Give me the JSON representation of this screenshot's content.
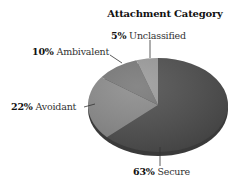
{
  "chart_data": {
    "type": "pie",
    "title": "Attachment Category",
    "categories": [
      "Secure",
      "Avoidant",
      "Ambivalent",
      "Unclassified"
    ],
    "values": [
      63,
      22,
      10,
      5
    ],
    "labels": [
      "63% Secure",
      "22% Avoidant",
      "10% Ambivalent",
      "5% Unclassified"
    ],
    "colors": [
      "#4d4d4d",
      "#8a8a8a",
      "#777777",
      "#9a9a9a"
    ],
    "start_angle": "12 o'clock, clockwise",
    "legend": "none (callout labels with leader lines)",
    "style": "3D tilted pie"
  },
  "labels": {
    "title": "Attachment Category",
    "secure_pct": "63%",
    "secure_name": "Secure",
    "avoidant_pct": "22%",
    "avoidant_name": "Avoidant",
    "ambivalent_pct": "10%",
    "ambivalent_name": "Ambivalent",
    "unclassified_pct": "5%",
    "unclassified_name": "Unclassified"
  }
}
